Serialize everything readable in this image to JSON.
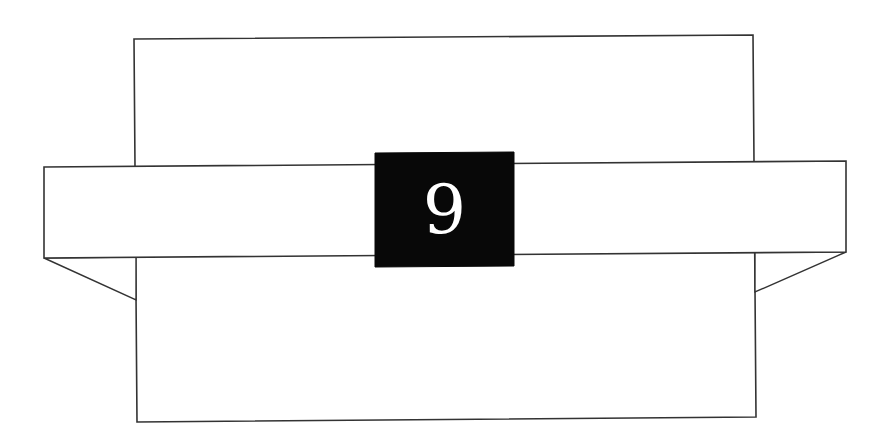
{
  "diagram": {
    "chapter_number": "9",
    "colors": {
      "background": "#ffffff",
      "line": "#333333",
      "label_box": "#080808",
      "numeral": "#ffffff"
    }
  }
}
